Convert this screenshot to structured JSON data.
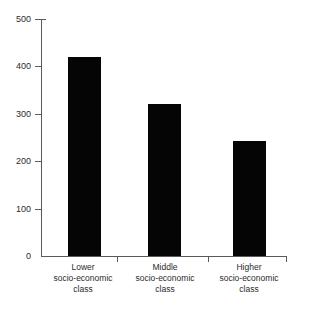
{
  "chart_data": {
    "type": "bar",
    "title": "",
    "subtitle": "",
    "xlabel": "",
    "ylabel": "",
    "categories": [
      "Lower\nsocio-economic\nclass",
      "Middle\nsocio-economic\nclass",
      "Higher\nsocio-economic\nclass"
    ],
    "category_lines": [
      [
        "Lower",
        "socio-economic",
        "class"
      ],
      [
        "Middle",
        "socio-economic",
        "class"
      ],
      [
        "Higher",
        "socio-economic",
        "class"
      ]
    ],
    "values": [
      420,
      320,
      242
    ],
    "ylim": [
      0,
      500
    ],
    "yticks": [
      0,
      100,
      200,
      300,
      400,
      500
    ],
    "ytick_labels": [
      "0",
      "100",
      "200",
      "300",
      "400",
      "500"
    ],
    "grid": false,
    "legend": null,
    "bar_color": "#050505",
    "axis_color": "#5a5a5a",
    "background_color": "#ffffff"
  },
  "axes": {
    "y_labels": {
      "t500": "500",
      "t400": "400",
      "t300": "300",
      "t200": "200",
      "t100": "100",
      "t0": "0"
    }
  },
  "categories_text": {
    "cat0": {
      "line1": "Lower",
      "line2": "socio-economic",
      "line3": "class"
    },
    "cat1": {
      "line1": "Middle",
      "line2": "socio-economic",
      "line3": "class"
    },
    "cat2": {
      "line1": "Higher",
      "line2": "socio-economic",
      "line3": "class"
    }
  }
}
